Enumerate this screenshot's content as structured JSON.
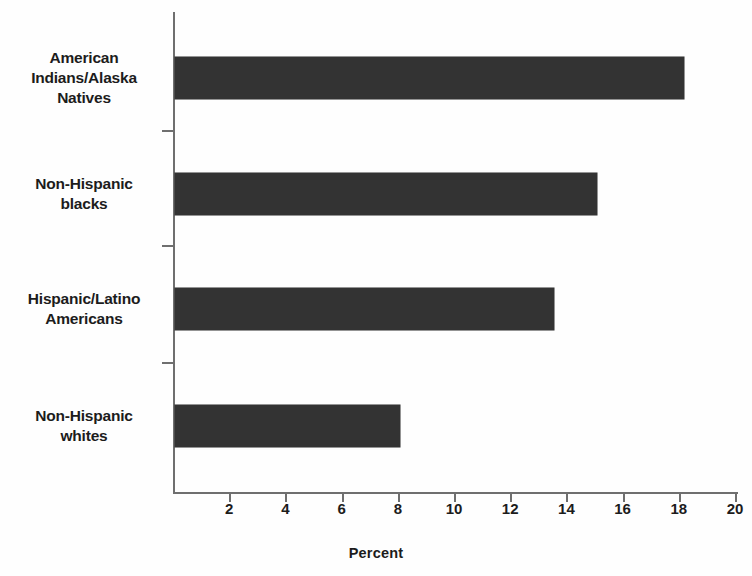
{
  "chart_data": {
    "type": "bar",
    "orientation": "horizontal",
    "title": "",
    "categories": [
      "American Indians/Alaska Natives",
      "Non-Hispanic blacks",
      "Hispanic/Latino Americans",
      "Non-Hispanic whites"
    ],
    "category_lines": [
      [
        "American",
        "Indians/Alaska",
        "Natives"
      ],
      [
        "Non-Hispanic",
        "blacks"
      ],
      [
        "Hispanic/Latino",
        "Americans"
      ],
      [
        "Non-Hispanic",
        "whites"
      ]
    ],
    "values": [
      18.1,
      15.0,
      13.5,
      8.0
    ],
    "xlabel": "Percent",
    "ylabel": "",
    "xlim": [
      0,
      20
    ],
    "xticks": [
      2,
      4,
      6,
      8,
      10,
      12,
      14,
      16,
      18,
      20
    ],
    "xtick_labels": [
      "2",
      "4",
      "6",
      "8",
      "10",
      "12",
      "14",
      "16",
      "18",
      "20"
    ],
    "grid": false,
    "legend": null,
    "bar_color": "#333333",
    "axis_color": "#6f6f6f",
    "text_color": "#1c1c1c"
  },
  "bleed_through": {
    "top": "",
    "middle": "",
    "lower": ""
  }
}
